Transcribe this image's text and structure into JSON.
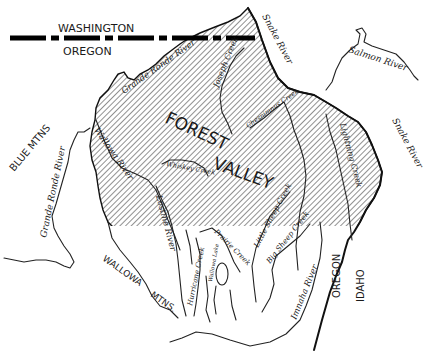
{
  "map": {
    "state_line": {
      "north": "WASHINGTON",
      "south": "OREGON"
    },
    "state_line_east": {
      "west": "OREGON",
      "east": "IDAHO"
    },
    "region_labels": {
      "forest": "FOREST",
      "valley": "VALLEY",
      "blue_mtns": "BLUE MTNS",
      "wallowa": "WALLOWA",
      "mtns": "MTNS."
    },
    "rivers": {
      "snake_north": "Snake River",
      "snake_east": "Snake River",
      "salmon": "Salmon River",
      "grande_ronde_north": "Grande Ronde River",
      "grande_ronde_west": "Grande Ronde River",
      "wallowa": "Wallowa River",
      "lostine": "Lostine River",
      "imnaha": "Imnaha River"
    },
    "creeks": {
      "joseph": "Joseph Creek",
      "chesnimnus": "Chesnimnus Creek",
      "lightning": "Lightning Creek",
      "whiskey": "Whiskey Creek",
      "prairie": "Prairie Creek",
      "hurricane": "Hurricane Creek",
      "little_sheep": "Little Sheep Creek",
      "big_sheep": "Big Sheep Creek"
    },
    "lakes": {
      "wallowa": "Wallowa Lake"
    },
    "colors": {
      "ink": "#1a1a1a",
      "background": "#ffffff",
      "hatch": "#555555"
    }
  }
}
